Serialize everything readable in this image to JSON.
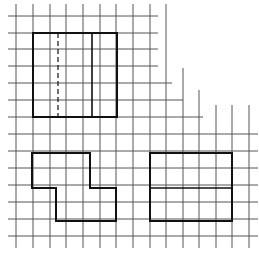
{
  "diagram": {
    "title": "",
    "background": "#ffffff",
    "grid": {
      "color": "#555555",
      "stroke_width": 1,
      "vertical_lines_x": [
        16,
        33,
        50,
        66,
        83,
        100,
        116,
        133,
        150,
        166,
        183,
        199,
        216,
        232,
        249
      ],
      "horizontal_lines_y": [
        16,
        33,
        49,
        66,
        83,
        100,
        117,
        134,
        151,
        168,
        185,
        202,
        219,
        236
      ],
      "staircase_cut": "top-right region left blank, stepped edge"
    },
    "shapes": [
      {
        "name": "top-rectangle",
        "type": "rectangle",
        "points": "33,33 117,33 117,117 33,117",
        "stroke": "#111111",
        "stroke_width": 2,
        "inner_lines": [
          {
            "name": "dashed-divider",
            "x1": 58,
            "y1": 33,
            "x2": 58,
            "y2": 117,
            "dashed": true
          },
          {
            "name": "solid-divider",
            "x1": 92,
            "y1": 33,
            "x2": 92,
            "y2": 117,
            "dashed": false
          }
        ]
      },
      {
        "name": "l-shape",
        "type": "polygon",
        "points": "32,153 90,153 90,188 116,188 116,221 56,221 56,188 32,188",
        "stroke": "#111111",
        "stroke_width": 2,
        "inner_lines": []
      },
      {
        "name": "right-rectangle",
        "type": "rectangle",
        "points": "150,153 232,153 232,221 150,221",
        "stroke": "#111111",
        "stroke_width": 2,
        "inner_lines": [
          {
            "name": "horizontal-divider",
            "x1": 150,
            "y1": 188,
            "x2": 232,
            "y2": 188,
            "dashed": false
          }
        ]
      }
    ]
  }
}
